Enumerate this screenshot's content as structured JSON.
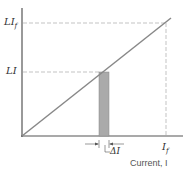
{
  "labels": {
    "y_top": "LI",
    "y_top_sub": "f",
    "y_mid": "LI",
    "x_end": "I",
    "x_end_sub": "f",
    "delta": "ΔI",
    "x_axis": "Current, I"
  },
  "colors": {
    "line": "#888888",
    "bar": "#aaaaaa",
    "axis": "#555555",
    "dash": "#aaaaaa"
  }
}
